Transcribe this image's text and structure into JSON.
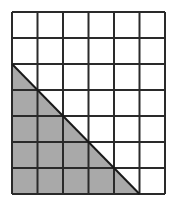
{
  "diagram": {
    "grid": {
      "columns": 6,
      "rows": 7,
      "x": 12,
      "y": 12,
      "width": 153,
      "height": 182,
      "line_color": "#2a2a2a",
      "line_width": 2
    },
    "triangle": {
      "points": [
        [
          0,
          2
        ],
        [
          0,
          7
        ],
        [
          5,
          7
        ]
      ],
      "fill": "#a9a9a9",
      "stroke": "#1a1a1a"
    },
    "background": "#ffffff"
  }
}
